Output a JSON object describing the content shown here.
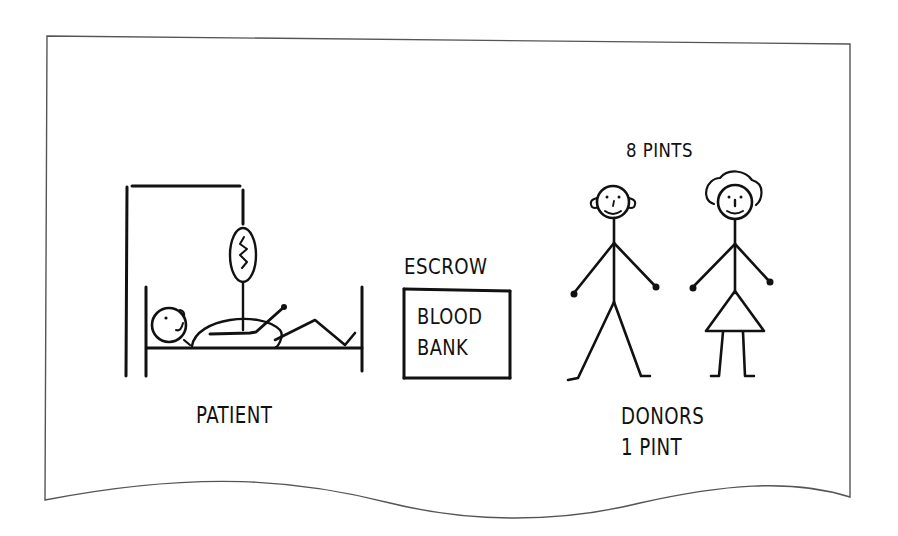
{
  "illustration": {
    "patient": {
      "label": "PATIENT",
      "icon": "patient-in-bed-with-iv-icon"
    },
    "escrow": {
      "title": "ESCROW",
      "box_line1": "BLOOD",
      "box_line2": "BANK",
      "icon": "blood-bank-box-icon"
    },
    "donors": {
      "top_label": "8 PINTS",
      "bottom_line1": "DONORS",
      "bottom_line2": "1 PINT",
      "icons": [
        "male-stick-figure-icon",
        "female-stick-figure-icon"
      ]
    }
  },
  "colors": {
    "ink": "#111111",
    "frame": "#555555",
    "background": "#ffffff"
  }
}
